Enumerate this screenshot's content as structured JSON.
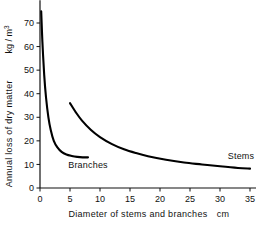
{
  "chart_data": {
    "type": "line",
    "title": "",
    "xlabel": "Diameter of stems and branches",
    "xunit": "cm",
    "ylabel": "Annual loss of dry matter",
    "yunit": "kg / m",
    "yunit_exponent": "3",
    "xlim": [
      0,
      36
    ],
    "ylim": [
      0,
      78
    ],
    "xticks": [
      0,
      5,
      10,
      15,
      20,
      25,
      30,
      35
    ],
    "yticks": [
      0,
      10,
      20,
      30,
      40,
      50,
      60,
      70
    ],
    "xticklabels": [
      "0",
      "5",
      "10",
      "15",
      "20",
      "25",
      "30",
      "35"
    ],
    "yticklabels": [
      "0",
      "10",
      "20",
      "30",
      "40",
      "50",
      "60",
      "70"
    ],
    "grid": false,
    "legend_position": "inline-annotations",
    "series": [
      {
        "name": "Branches",
        "label_text": "Branches",
        "color": "#000000",
        "x": [
          0.2,
          0.4,
          0.7,
          1.0,
          1.4,
          1.8,
          2.3,
          2.9,
          3.6,
          4.4,
          5.3,
          6.2,
          7.1,
          8.0
        ],
        "y": [
          75.0,
          62.0,
          48.0,
          38.5,
          30.0,
          24.5,
          20.0,
          17.2,
          15.3,
          14.2,
          13.6,
          13.2,
          13.0,
          13.0
        ]
      },
      {
        "name": "Stems",
        "label_text": "Stems",
        "color": "#000000",
        "x": [
          5.0,
          6.0,
          7.0,
          8.5,
          10.0,
          12.0,
          14.0,
          16.0,
          18.0,
          21.0,
          24.0,
          27.0,
          30.0,
          33.0,
          35.0
        ],
        "y": [
          36.0,
          32.0,
          28.6,
          24.6,
          21.6,
          18.6,
          16.4,
          14.8,
          13.5,
          12.0,
          10.8,
          10.0,
          9.2,
          8.5,
          8.2
        ]
      }
    ],
    "annotations": [
      {
        "text": "Branches",
        "x": 8.0,
        "y": 8.5
      },
      {
        "text": "Stems",
        "x": 33.5,
        "y": 12.5
      }
    ]
  }
}
